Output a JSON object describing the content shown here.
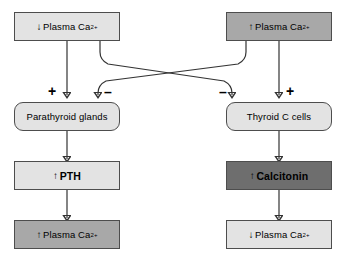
{
  "diagram": {
    "colors": {
      "fill_light": "#e3e3e3",
      "fill_mid": "#a8a8a8",
      "fill_dark": "#6e6e6e",
      "border": "#4d4d4d",
      "line": "#333333",
      "text": "#000000"
    },
    "nodes": {
      "top_left": {
        "arrow": "↓",
        "label": "Plasma Ca",
        "sup": "2+",
        "shade": "light"
      },
      "top_right": {
        "arrow": "↑",
        "label": "Plasma Ca",
        "sup": "2+",
        "shade": "mid"
      },
      "mid_left": {
        "label": "Parathyroid glands",
        "shade": "light"
      },
      "mid_right": {
        "label": "Thyroid C cells",
        "shade": "light"
      },
      "hormone_left": {
        "arrow": "↑",
        "label": "PTH",
        "shade": "light"
      },
      "hormone_right": {
        "arrow": "↑",
        "label": "Calcitonin",
        "shade": "dark"
      },
      "bottom_left": {
        "arrow": "↑",
        "label": "Plasma Ca",
        "sup": "2+",
        "shade": "mid"
      },
      "bottom_right": {
        "arrow": "↓",
        "label": "Plasma Ca",
        "sup": "2+",
        "shade": "light"
      }
    },
    "signs": {
      "left_plus": "+",
      "left_minus": "–",
      "right_minus": "–",
      "right_plus": "+"
    }
  }
}
